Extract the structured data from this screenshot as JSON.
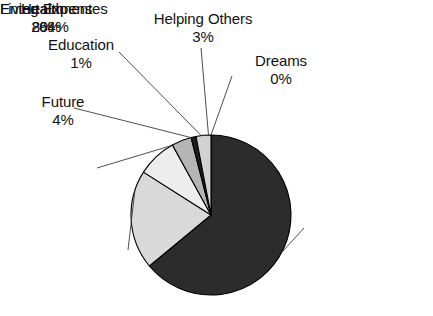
{
  "chart_data": {
    "type": "pie",
    "title": "",
    "categories": [
      "Living Expenses",
      "Entertainment",
      "Health",
      "Future",
      "Education",
      "Helping Others",
      "Dreams"
    ],
    "values": [
      64,
      20,
      8,
      4,
      1,
      3,
      0
    ],
    "value_unit": "%",
    "labels": [
      {
        "id": "living",
        "category": "Living Expenses",
        "value": "64%",
        "color": "#2c2c2c"
      },
      {
        "id": "entertainment",
        "category": "Entertainment",
        "value": "20%",
        "color": "#d9d9d9"
      },
      {
        "id": "health",
        "category": "Health",
        "value": "8%",
        "color": "#ededed"
      },
      {
        "id": "future",
        "category": "Future",
        "value": "4%",
        "color": "#b5b5b5"
      },
      {
        "id": "education",
        "category": "Education",
        "value": "1%",
        "color": "#1c1c1c"
      },
      {
        "id": "helping-others",
        "category": "Helping Others",
        "value": "3%",
        "color": "#d2d2d2"
      },
      {
        "id": "dreams",
        "category": "Dreams",
        "value": "0%",
        "color": "#ffffff"
      }
    ],
    "legend_position": "callouts",
    "grid": false,
    "start_angle_deg": 0,
    "direction": "clockwise",
    "geometry": {
      "cx": 211,
      "cy": 215,
      "r": 80
    },
    "stroke_color": "#000000",
    "background": "#ffffff"
  },
  "callouts": {
    "helping_others": {
      "cat": "Helping Others",
      "val": "3%"
    },
    "education": {
      "cat": "Education",
      "val": "1%"
    },
    "dreams": {
      "cat": "Dreams",
      "val": "0%"
    },
    "future": {
      "cat": "Future",
      "val": "4%"
    },
    "health": {
      "cat": "Health",
      "val": "8%"
    },
    "entertainment": {
      "cat": "Entertainment",
      "val": "20%"
    },
    "living": {
      "cat": "Living Expenses",
      "val": "64%"
    }
  }
}
